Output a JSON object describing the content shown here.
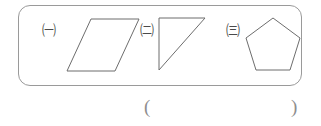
{
  "canvas": {
    "width": 321,
    "height": 126,
    "background": "#ffffff",
    "stroke_color": "#6d6d6d",
    "box_border_color": "#9a9a9a",
    "text_color": "#4a4a4a"
  },
  "shape_box": {
    "name": "figure-panel",
    "figures": [
      {
        "tag": "㈠",
        "tag_meaning": "circled-korean-giyeok",
        "shape": "parallelogram",
        "points": "36,4 84,4 60,56 12,56"
      },
      {
        "tag": "㈡",
        "tag_meaning": "circled-korean-nieun",
        "shape": "right-triangle",
        "points": "2,3 48,3 2,55"
      },
      {
        "tag": "㈢",
        "tag_meaning": "circled-korean-digeut",
        "shape": "regular-pentagon",
        "points": "30,3 57,23 47,55 13,55 3,23"
      }
    ]
  },
  "answer_blank": {
    "open_paren": "(",
    "close_paren": ")"
  }
}
